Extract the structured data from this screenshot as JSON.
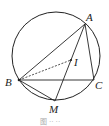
{
  "diagram": {
    "circle": {
      "cx": 56,
      "cy": 56,
      "r": 44
    },
    "points": {
      "A": {
        "label": "A",
        "x": 85,
        "y": 24
      },
      "B": {
        "label": "B",
        "x": 19,
        "y": 80
      },
      "C": {
        "label": "C",
        "x": 94,
        "y": 80
      },
      "M": {
        "label": "M",
        "x": 55,
        "y": 101
      },
      "I": {
        "label": "I",
        "x": 71,
        "y": 60
      }
    },
    "segments": [
      "AB",
      "AC",
      "BC",
      "AM",
      "BM"
    ],
    "dashed_segments": [
      "BI"
    ],
    "caption": "图 ·· ··"
  }
}
